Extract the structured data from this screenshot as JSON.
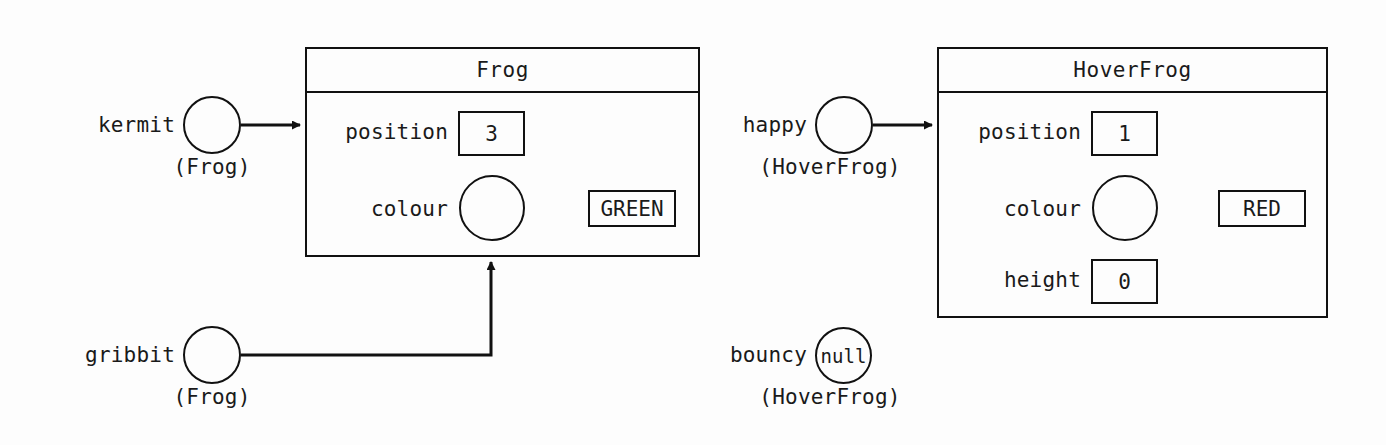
{
  "diagram": {
    "line_color": "#111111",
    "background_color": "#fdfdfd"
  },
  "objects": [
    {
      "id": "frog-object",
      "class_name": "Frog",
      "fields": [
        {
          "name": "position",
          "kind": "primitive",
          "value": "3"
        },
        {
          "name": "colour",
          "kind": "reference",
          "value": "GREEN"
        }
      ]
    },
    {
      "id": "hoverfrog-object",
      "class_name": "HoverFrog",
      "fields": [
        {
          "name": "position",
          "kind": "primitive",
          "value": "1"
        },
        {
          "name": "colour",
          "kind": "reference",
          "value": "RED"
        },
        {
          "name": "height",
          "kind": "primitive",
          "value": "0"
        }
      ]
    }
  ],
  "variables": [
    {
      "id": "kermit-variable",
      "name": "kermit",
      "type": "(Frog)",
      "circle_text": "",
      "points_to": "frog-object"
    },
    {
      "id": "gribbit-variable",
      "name": "gribbit",
      "type": "(Frog)",
      "circle_text": "",
      "points_to": "frog-object"
    },
    {
      "id": "happy-variable",
      "name": "happy",
      "type": "(HoverFrog)",
      "circle_text": "",
      "points_to": "hoverfrog-object"
    },
    {
      "id": "bouncy-variable",
      "name": "bouncy",
      "type": "(HoverFrog)",
      "circle_text": "null",
      "points_to": null
    }
  ]
}
